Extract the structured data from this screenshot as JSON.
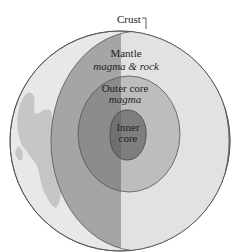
{
  "diagram": {
    "labels": {
      "crust": "Crust",
      "mantle": "Mantle",
      "mantle_sub": "magma & rock",
      "outer_core": "Outer core",
      "outer_core_sub": "magma",
      "inner_core_line1": "Inner",
      "inner_core_line2": "core"
    },
    "colors": {
      "background": "#ffffff",
      "globe_light": "#e6e6e6",
      "continent": "#c4c4c4",
      "mantle_dark": "#a3a3a3",
      "mantle_light": "#e2e2e2",
      "outer_core_dark": "#8a8a8a",
      "outer_core_light": "#bcbcbc",
      "inner_core_dark": "#6e6e6e",
      "inner_core_light": "#7c7c7c",
      "outline": "#555555"
    }
  }
}
